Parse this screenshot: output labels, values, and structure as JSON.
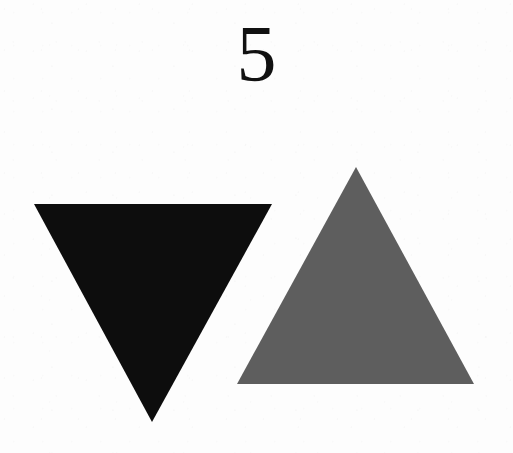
{
  "page": {
    "background_color": "#fdfdfd",
    "width": 513,
    "height": 453
  },
  "figure": {
    "number_label": "5",
    "number_color": "#111111"
  },
  "chart_data": {
    "type": "diagram",
    "title": "5",
    "subtitle": "",
    "xlabel": "",
    "ylabel": "",
    "background": "#fdfdfd",
    "grid": false,
    "legend_position": "none",
    "annotations": [
      {
        "text": "5",
        "x": 256,
        "y": 58,
        "role": "figure-number"
      }
    ],
    "shapes": [
      {
        "name": "black-inverted-triangle",
        "type": "triangle",
        "orientation": "pointing-down",
        "fill": "#0d0d0d",
        "points": [
          [
            34,
            204
          ],
          [
            272,
            204
          ],
          [
            152,
            422
          ]
        ],
        "base_width": 238,
        "height": 218,
        "centroid": [
          153,
          277
        ]
      },
      {
        "name": "gray-upright-triangle",
        "type": "triangle",
        "orientation": "pointing-up",
        "fill": "#5e5e5e",
        "points": [
          [
            356,
            167
          ],
          [
            474,
            384
          ],
          [
            237,
            384
          ]
        ],
        "base_width": 237,
        "height": 217,
        "centroid": [
          356,
          312
        ]
      }
    ]
  },
  "shapes": {
    "black_triangle": {
      "label": "black-inverted-triangle",
      "fill": "#0d0d0d",
      "points": "34,204 272,204 152,422"
    },
    "gray_triangle": {
      "label": "gray-upright-triangle",
      "fill": "#5e5e5e",
      "points": "356,167 474,384 237,384"
    }
  }
}
